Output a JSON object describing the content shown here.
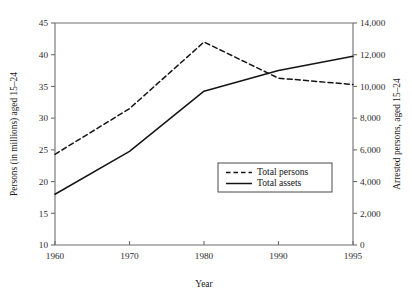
{
  "chart_data": {
    "type": "line",
    "title": "",
    "xlabel": "Year",
    "ylabel": "Persons (in millions) aged 15–24",
    "y2label": "Arrested persons, aged 15–24",
    "x": [
      1960,
      1970,
      1980,
      1990,
      1995
    ],
    "xtick_labels": [
      "1960",
      "1970",
      "1980",
      "1990",
      "1995"
    ],
    "xtick_spacing": "categorical-equal",
    "ylim": [
      10,
      45
    ],
    "yticks": [
      10,
      15,
      20,
      25,
      30,
      35,
      40,
      45
    ],
    "ytick_labels": [
      "10",
      "15",
      "20",
      "25",
      "30",
      "35",
      "40",
      "45"
    ],
    "y2lim": [
      0,
      14000
    ],
    "y2ticks": [
      0,
      2000,
      4000,
      6000,
      8000,
      10000,
      12000,
      14000
    ],
    "y2tick_labels": [
      "0",
      "2,000",
      "4,000",
      "6,000",
      "8,000",
      "10,000",
      "12,000",
      "14,000"
    ],
    "grid": false,
    "legend_position": "inside-lower-right",
    "series": [
      {
        "name": "Total persons",
        "axis": "left",
        "style": "dashed",
        "color": "#141414",
        "values": [
          24.3,
          31.5,
          42.0,
          36.3,
          35.3
        ]
      },
      {
        "name": "Total assets",
        "axis": "right",
        "style": "solid",
        "color": "#141414",
        "values": [
          3200,
          5900,
          9700,
          11000,
          11900
        ]
      }
    ]
  },
  "legend": {
    "items": [
      {
        "label": "Total persons",
        "style": "dashed"
      },
      {
        "label": "Total assets",
        "style": "solid"
      }
    ]
  }
}
